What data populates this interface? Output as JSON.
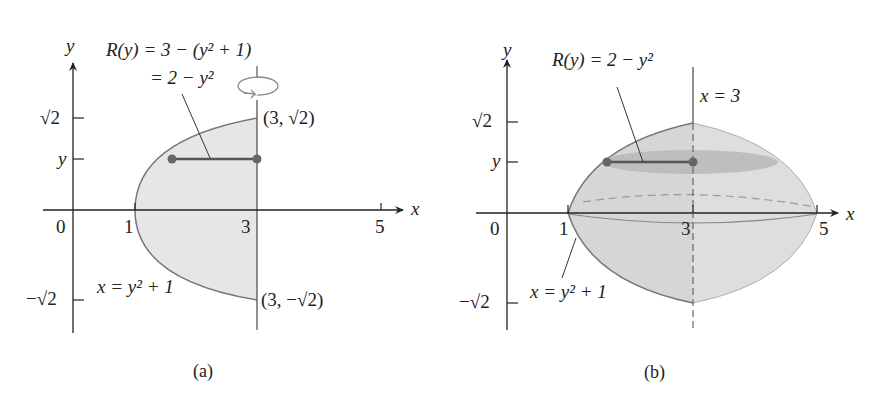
{
  "panels": [
    {
      "id": "a",
      "caption": "(a)",
      "axis_labels": {
        "x": "x",
        "y": "y"
      },
      "x_ticks": [
        "0",
        "1",
        "3",
        "5"
      ],
      "y_ticks": [
        "√2",
        "y",
        "−√2"
      ],
      "radius_label_line1": "R(y) = 3 − (y² + 1)",
      "radius_label_line2": "= 2 − y²",
      "curve_label": "x = y² + 1",
      "point_top": "(3, √2)",
      "point_bottom": "(3, −√2)",
      "rotation_icon": "rotation-arrow-icon"
    },
    {
      "id": "b",
      "caption": "(b)",
      "axis_labels": {
        "x": "x",
        "y": "y"
      },
      "x_ticks": [
        "0",
        "1",
        "3",
        "5"
      ],
      "y_ticks": [
        "√2",
        "y",
        "−√2"
      ],
      "radius_label": "R(y) = 2 − y²",
      "axis_of_rotation_label": "x = 3",
      "curve_label": "x = y² + 1"
    }
  ],
  "colors": {
    "region_fill": "#e4e4e4",
    "solid_fill": "#d2d2d2",
    "disk_fill": "#b4b4b4",
    "line": "#333333",
    "curve": "#666666",
    "point": "#666666"
  }
}
